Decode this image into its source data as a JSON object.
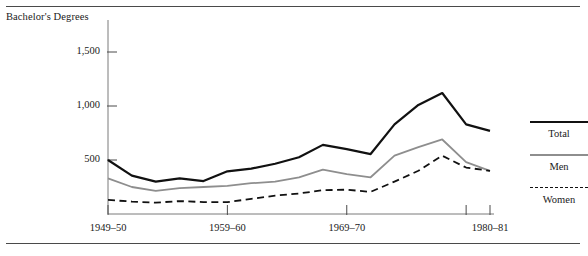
{
  "figure": {
    "axis_title": "Bachelor's Degrees"
  },
  "legend": {
    "position": "right",
    "entries": [
      {
        "label": "Total",
        "style": "solid",
        "color": "#111111",
        "width": 2.2
      },
      {
        "label": "Men",
        "style": "solid",
        "color": "#8e8e8e",
        "width": 1.8
      },
      {
        "label": "Women",
        "style": "dashed",
        "color": "#111111",
        "width": 1.8
      }
    ]
  },
  "chart_data": {
    "type": "line",
    "title": "",
    "subtitle": "",
    "xlabel": "",
    "ylabel": "Bachelor's Degrees",
    "ylim": [
      0,
      1600
    ],
    "yticks": [
      500,
      1000,
      1500
    ],
    "ytick_labels": [
      "500",
      "1,000",
      "1,500"
    ],
    "grid": false,
    "units": "thousands of degrees conferred",
    "x": [
      "1949-50",
      "1951-52",
      "1953-54",
      "1955-56",
      "1957-58",
      "1959-60",
      "1961-62",
      "1963-64",
      "1965-66",
      "1967-68",
      "1969-70",
      "1971-72",
      "1973-74",
      "1975-76",
      "1977-78",
      "1979-80",
      "1980-81"
    ],
    "xticks": [
      "1949-50",
      "1959-60",
      "1969-70",
      "1980-81"
    ],
    "xtick_labels": [
      "1949–50",
      "1959–60",
      "1969–70",
      "1980–81"
    ],
    "series": [
      {
        "name": "Total",
        "style": "solid",
        "color": "#111111",
        "values": [
          500,
          355,
          300,
          330,
          305,
          395,
          420,
          465,
          525,
          640,
          600,
          555,
          830,
          1010,
          1120,
          830,
          770
        ]
      },
      {
        "name": "Men",
        "style": "solid",
        "color": "#8e8e8e",
        "values": [
          330,
          250,
          215,
          240,
          250,
          260,
          285,
          300,
          340,
          410,
          370,
          340,
          540,
          620,
          690,
          480,
          400
        ]
      },
      {
        "name": "Women",
        "style": "dashed",
        "color": "#111111",
        "values": [
          130,
          115,
          105,
          120,
          110,
          110,
          140,
          170,
          190,
          220,
          225,
          205,
          300,
          400,
          540,
          430,
          400
        ]
      }
    ]
  }
}
